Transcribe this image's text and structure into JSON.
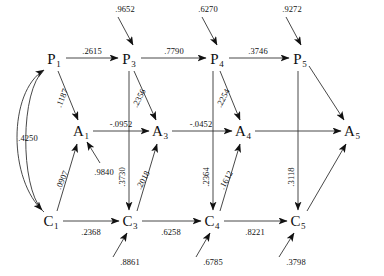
{
  "diagram": {
    "type": "path-diagram",
    "nodes": [
      {
        "id": "P1",
        "label": "P",
        "sub": "1",
        "x": 54,
        "y": 60
      },
      {
        "id": "P3",
        "label": "P",
        "sub": "3",
        "x": 129,
        "y": 60
      },
      {
        "id": "P4",
        "label": "P",
        "sub": "4",
        "x": 217,
        "y": 60
      },
      {
        "id": "P5",
        "label": "P",
        "sub": "5",
        "x": 300,
        "y": 60
      },
      {
        "id": "A1",
        "label": "A",
        "sub": "1",
        "x": 81,
        "y": 132
      },
      {
        "id": "A3",
        "label": "A",
        "sub": "3",
        "x": 160,
        "y": 132
      },
      {
        "id": "A4",
        "label": "A",
        "sub": "4",
        "x": 243,
        "y": 132
      },
      {
        "id": "A5",
        "label": "A",
        "sub": "5",
        "x": 352,
        "y": 132
      },
      {
        "id": "C1",
        "label": "C",
        "sub": "1",
        "x": 51,
        "y": 222
      },
      {
        "id": "C3",
        "label": "C",
        "sub": "3",
        "x": 130,
        "y": 222
      },
      {
        "id": "C4",
        "label": "C",
        "sub": "4",
        "x": 212,
        "y": 222
      },
      {
        "id": "C5",
        "label": "C",
        "sub": "5",
        "x": 298,
        "y": 222
      }
    ],
    "edges": [
      {
        "from": "P1",
        "to": "P3",
        "value": ".2615",
        "lx": 92,
        "ly": 51,
        "rot": 0
      },
      {
        "from": "P3",
        "to": "P4",
        "value": ".7790",
        "lx": 174,
        "ly": 51,
        "rot": 0
      },
      {
        "from": "P4",
        "to": "P5",
        "value": ".3746",
        "lx": 258,
        "ly": 51,
        "rot": 0
      },
      {
        "from": "A1",
        "to": "A3",
        "value": "-.0952",
        "lx": 121,
        "ly": 124,
        "rot": 0
      },
      {
        "from": "A3",
        "to": "A4",
        "value": "-.0452",
        "lx": 201,
        "ly": 124,
        "rot": 0
      },
      {
        "from": "A4",
        "to": "A5",
        "value": "",
        "lx": 0,
        "ly": 0,
        "rot": 0
      },
      {
        "from": "C1",
        "to": "C3",
        "value": ".2368",
        "lx": 91,
        "ly": 232,
        "rot": 0
      },
      {
        "from": "C3",
        "to": "C4",
        "value": ".6258",
        "lx": 171,
        "ly": 232,
        "rot": 0
      },
      {
        "from": "C4",
        "to": "C5",
        "value": ".8221",
        "lx": 255,
        "ly": 232,
        "rot": 0
      },
      {
        "from": "P1",
        "to": "A1",
        "value": ".1187",
        "lx": 62,
        "ly": 98,
        "rot": -68
      },
      {
        "from": "P3",
        "to": "A3",
        "value": ".2356",
        "lx": 139,
        "ly": 98,
        "rot": -63
      },
      {
        "from": "P4",
        "to": "A4",
        "value": ".2254",
        "lx": 223,
        "ly": 98,
        "rot": -63
      },
      {
        "from": "P3",
        "to": "C3",
        "value": ".3730",
        "lx": 122,
        "ly": 177,
        "rot": -90
      },
      {
        "from": "P4",
        "to": "C4",
        "value": ".2364",
        "lx": 206,
        "ly": 177,
        "rot": -90
      },
      {
        "from": "P5",
        "to": "C5",
        "value": ".3118",
        "lx": 291,
        "ly": 177,
        "rot": -90
      },
      {
        "from": "C1",
        "to": "A1",
        "value": ".0907",
        "lx": 62,
        "ly": 180,
        "rot": -66
      },
      {
        "from": "C3",
        "to": "A3",
        "value": ".2018",
        "lx": 143,
        "ly": 180,
        "rot": -62
      },
      {
        "from": "C4",
        "to": "A4",
        "value": ".1612",
        "lx": 226,
        "ly": 180,
        "rot": -62
      },
      {
        "from": "C1",
        "to": "P1",
        "value": ".4250",
        "lx": 28,
        "ly": 138,
        "rot": 0
      }
    ],
    "exogenous_inputs": [
      {
        "target": "P3",
        "value": ".9652",
        "lx": 125,
        "ly": 9
      },
      {
        "target": "P4",
        "value": ".6270",
        "lx": 208,
        "ly": 9
      },
      {
        "target": "P5",
        "value": ".9272",
        "lx": 292,
        "ly": 9
      },
      {
        "target": "A1",
        "value": ".9840",
        "lx": 104,
        "ly": 172
      },
      {
        "target": "C3",
        "value": ".8861",
        "lx": 130,
        "ly": 262
      },
      {
        "target": "C4",
        "value": ".6785",
        "lx": 213,
        "ly": 262
      },
      {
        "target": "C5",
        "value": ".3798",
        "lx": 296,
        "ly": 262
      }
    ]
  }
}
